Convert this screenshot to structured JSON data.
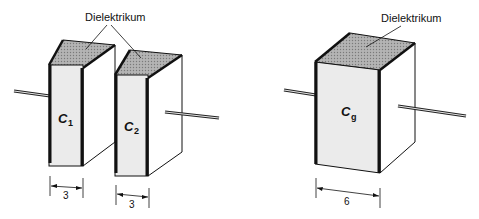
{
  "labels": {
    "dielectric_left": "Dielektrikum",
    "dielectric_right": "Dielektrikum"
  },
  "capacitors": [
    {
      "id": "c1",
      "symbol": "C",
      "subscript": "1",
      "thickness": "3"
    },
    {
      "id": "c2",
      "symbol": "C",
      "subscript": "2",
      "thickness": "3"
    },
    {
      "id": "cg",
      "symbol": "C",
      "subscript": "g",
      "thickness": "6"
    }
  ],
  "colors": {
    "front_face": "#ebebeb",
    "top_face": "#a8a8a8",
    "side_face": "#ffffff",
    "plate": "#111111",
    "line": "#111111"
  }
}
